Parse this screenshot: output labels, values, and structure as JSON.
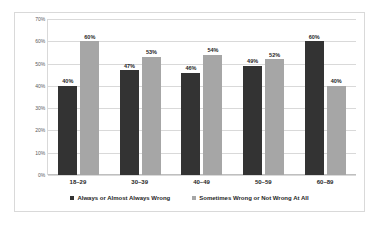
{
  "chart_data": {
    "type": "bar",
    "title": "",
    "subtitle": "",
    "xlabel": "",
    "ylabel": "",
    "categories": [
      "18–29",
      "30–39",
      "40–49",
      "50–59",
      "60–89"
    ],
    "series": [
      {
        "name": "Always or Almost Always Wrong",
        "color": "#333333",
        "values": [
          40,
          47,
          46,
          49,
          60
        ],
        "labels": [
          "40%",
          "47%",
          "46%",
          "49%",
          "60%"
        ]
      },
      {
        "name": "Sometimes Wrong or Not Wrong At All",
        "color": "#a6a6a6",
        "values": [
          60,
          53,
          54,
          52,
          40
        ],
        "labels": [
          "60%",
          "53%",
          "54%",
          "52%",
          "40%"
        ]
      }
    ],
    "ylim": [
      0,
      70
    ],
    "ytick_values": [
      0,
      10,
      20,
      30,
      40,
      50,
      60,
      70
    ],
    "ytick_labels": [
      "0%",
      "10%",
      "20%",
      "30%",
      "40%",
      "50%",
      "60%",
      "70%"
    ],
    "grid": true,
    "legend_position": "bottom",
    "gridline_color": "#d9d9d9",
    "border_color": "#d9d9d9",
    "background_color": "#ffffff"
  }
}
